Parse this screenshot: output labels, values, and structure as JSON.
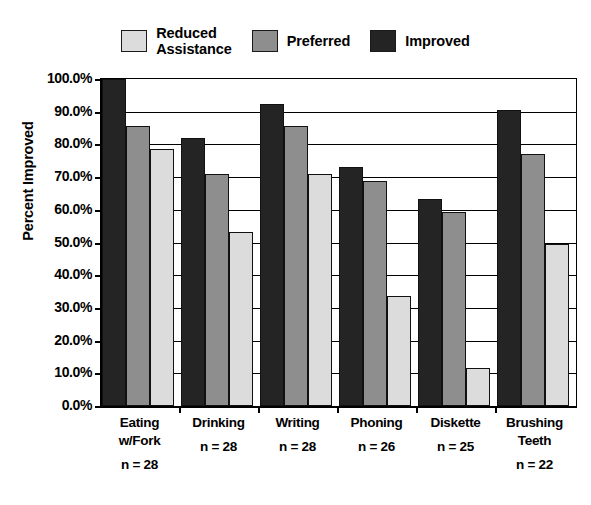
{
  "chart_data": {
    "type": "bar",
    "title": "",
    "xlabel": "",
    "ylabel": "Percent Improved",
    "ylim": [
      0,
      100
    ],
    "ytick_labels": [
      "100.0%",
      "90.0%",
      "80.0%",
      "70.0%",
      "60.0%",
      "50.0%",
      "40.0%",
      "30.0%",
      "20.0%",
      "10.0%",
      "0.0%"
    ],
    "ytick_values": [
      100,
      90,
      80,
      70,
      60,
      50,
      40,
      30,
      20,
      10,
      0
    ],
    "grid": true,
    "legend_position": "top",
    "categories": [
      "Eating\nw/Fork",
      "Drinking",
      "Writing",
      "Phoning",
      "Diskette",
      "Brushing\nTeeth"
    ],
    "category_notes": [
      "n = 28",
      "n = 28",
      "n = 28",
      "n = 26",
      "n = 25",
      "n = 22"
    ],
    "series": [
      {
        "name": "Improved",
        "color": "#242424",
        "values": [
          100.0,
          82.1,
          92.3,
          73.1,
          63.3,
          90.5
        ]
      },
      {
        "name": "Preferred",
        "color": "#8e8e8e",
        "values": [
          85.7,
          71.0,
          85.7,
          68.8,
          59.4,
          77.0
        ]
      },
      {
        "name": "Reduced Assistance",
        "color": "#dcdcdc",
        "values": [
          78.6,
          53.3,
          71.0,
          33.6,
          11.5,
          49.4
        ]
      }
    ]
  },
  "legend": {
    "items": [
      {
        "label": "Reduced\nAssistance",
        "color": "#dcdcdc"
      },
      {
        "label": "Preferred",
        "color": "#8e8e8e"
      },
      {
        "label": "Improved",
        "color": "#242424"
      }
    ]
  },
  "axis": {
    "y_title": "Percent Improved"
  }
}
